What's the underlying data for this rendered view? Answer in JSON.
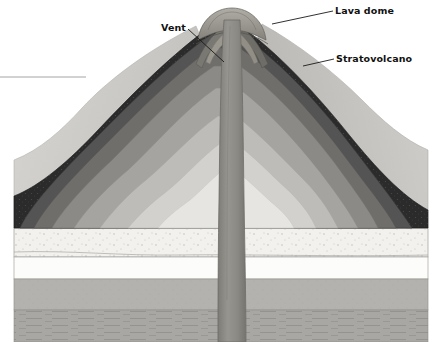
{
  "figure": {
    "type": "geologic-cross-section",
    "width": 442,
    "height": 342,
    "background": "#ffffff"
  },
  "labels": {
    "lava_dome": "Lava dome",
    "stratovolcano": "Stratovolcano",
    "vent": "Vent",
    "unlabeled_left": ""
  },
  "leader_lines": [
    {
      "name": "lava-dome-leader",
      "from": [
        333,
        11
      ],
      "to": [
        272,
        24
      ]
    },
    {
      "name": "stratovolcano-leader",
      "from": [
        334,
        59
      ],
      "to": [
        303,
        66
      ]
    },
    {
      "name": "vent-leader",
      "from": [
        188,
        29
      ],
      "to": [
        224,
        62
      ]
    },
    {
      "name": "left-edge-leader",
      "from": [
        0,
        77
      ],
      "to": [
        86,
        77
      ]
    }
  ],
  "colors": {
    "background": "#ffffff",
    "label_text": "#111111",
    "leader_line": "#1a1a1a",
    "outline": "#6b6b6b",
    "conduit": "#8e8c87",
    "conduit_edge": "#6e6c67",
    "dome_fill": "#9c9992",
    "flank_left": "#c9c8c4",
    "flank_right": "#bfbeba",
    "bed_speckled": "#f2f1ee",
    "bed_white": "#fcfcfb",
    "bed_gray": "#b3b2ae",
    "bed_hatched": "#a8a7a3"
  },
  "volcano_layers": [
    {
      "name": "layer-1-outermost",
      "tone": "#2b2b2b",
      "description": "near-black outer ash layer"
    },
    {
      "name": "layer-2",
      "tone": "#545454",
      "description": "dark gray layer"
    },
    {
      "name": "layer-3",
      "tone": "#6f6e6b",
      "description": "medium-dark gray layer"
    },
    {
      "name": "layer-4",
      "tone": "#8b8a86",
      "description": "medium gray layer"
    },
    {
      "name": "layer-5",
      "tone": "#a5a4a0",
      "description": "light-medium gray layer"
    },
    {
      "name": "layer-6",
      "tone": "#bdbcb8",
      "description": "light gray layer"
    },
    {
      "name": "layer-7",
      "tone": "#d2d1cd",
      "description": "very light gray layer"
    },
    {
      "name": "layer-8-core",
      "tone": "#e6e5e1",
      "description": "pale core layer"
    }
  ],
  "basement_beds": [
    {
      "name": "bed-speckled-sediment",
      "top": 229,
      "bottom": 256,
      "tone": "#f2f1ee",
      "pattern": "stippled"
    },
    {
      "name": "bed-white",
      "top": 256,
      "bottom": 279,
      "tone": "#fcfcfb",
      "pattern": "plain"
    },
    {
      "name": "bed-gray",
      "top": 279,
      "bottom": 310,
      "tone": "#b3b2ae",
      "pattern": "fine-grain"
    },
    {
      "name": "bed-hatched-bottom",
      "top": 310,
      "bottom": 342,
      "tone": "#a8a7a3",
      "pattern": "horizontal-hatch"
    }
  ],
  "conduit": {
    "name": "volcanic-conduit",
    "top_y": 20,
    "bottom_y": 342,
    "width_top": 18,
    "width_bottom": 26,
    "center_x": 232
  }
}
